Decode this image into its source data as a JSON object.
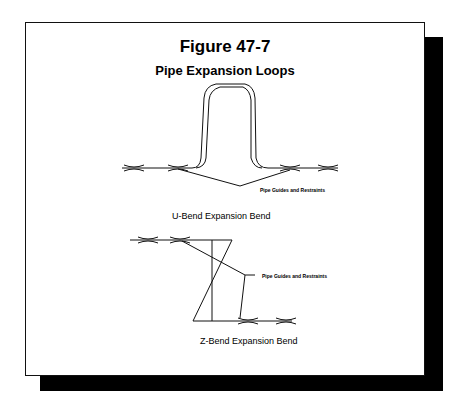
{
  "figure": {
    "number": "Figure 47-7",
    "title": "Pipe Expansion Loops"
  },
  "u_bend": {
    "caption": "U-Bend Expansion Bend",
    "callout": "Pipe Guides and Restraints"
  },
  "z_bend": {
    "caption": "Z-Bend Expansion Bend",
    "callout": "Pipe Guides and Restraints"
  },
  "colors": {
    "line": "#111111",
    "shadow": "#000000",
    "paper": "#ffffff"
  }
}
